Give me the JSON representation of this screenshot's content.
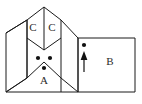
{
  "figure": {
    "background_color": "#ffffff",
    "line_color": "#1a1a1a",
    "label_color": "#2b2b2b",
    "marker_color": "#111111",
    "labels": {
      "region_a": "A",
      "region_b": "B",
      "region_c_left": "C",
      "region_c_right": "C"
    },
    "markers": {
      "dot_a_left": "dot-marker",
      "dot_a_right": "dot-marker",
      "dot_a_bottom": "dot-marker",
      "dot_b_top": "dot-marker",
      "arrow_b": "up-arrow-marker"
    },
    "geometry": {
      "apex": "44,7",
      "prism_left_bottom": "6,92",
      "prism_right_bottom": "78,92",
      "rect_b": "78,38 135,92",
      "fold_line_left_x": "27",
      "fold_line_right_x": "61"
    }
  }
}
